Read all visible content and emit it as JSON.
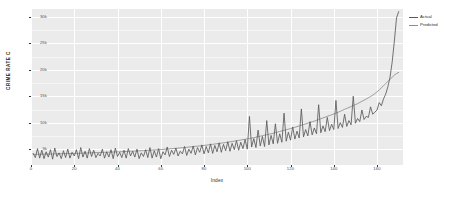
{
  "chart_data": {
    "type": "line",
    "title": "",
    "xlabel": "Index",
    "ylabel": "CRIME RATE C",
    "xlim": [
      0,
      172
    ],
    "ylim": [
      2000,
      31500
    ],
    "grid": true,
    "legend_position": "right",
    "xticks": [
      {
        "value": 0,
        "label": "0"
      },
      {
        "value": 20,
        "label": "20"
      },
      {
        "value": 40,
        "label": "40"
      },
      {
        "value": 60,
        "label": "60"
      },
      {
        "value": 80,
        "label": "80"
      },
      {
        "value": 100,
        "label": "100"
      },
      {
        "value": 120,
        "label": "120"
      },
      {
        "value": 140,
        "label": "140"
      },
      {
        "value": 160,
        "label": "160"
      }
    ],
    "yticks": [
      {
        "value": 5000,
        "label": "5k"
      },
      {
        "value": 10000,
        "label": "10k"
      },
      {
        "value": 15000,
        "label": "15k"
      },
      {
        "value": 20000,
        "label": "20k"
      },
      {
        "value": 25000,
        "label": "25k"
      },
      {
        "value": 30000,
        "label": "30k"
      }
    ],
    "series": [
      {
        "name": "Actual",
        "color": "#5a5a5a",
        "x": [
          1,
          2,
          3,
          4,
          5,
          6,
          7,
          8,
          9,
          10,
          11,
          12,
          13,
          14,
          15,
          16,
          17,
          18,
          19,
          20,
          21,
          22,
          23,
          24,
          25,
          26,
          27,
          28,
          29,
          30,
          31,
          32,
          33,
          34,
          35,
          36,
          37,
          38,
          39,
          40,
          41,
          42,
          43,
          44,
          45,
          46,
          47,
          48,
          49,
          50,
          51,
          52,
          53,
          54,
          55,
          56,
          57,
          58,
          59,
          60,
          61,
          62,
          63,
          64,
          65,
          66,
          67,
          68,
          69,
          70,
          71,
          72,
          73,
          74,
          75,
          76,
          77,
          78,
          79,
          80,
          81,
          82,
          83,
          84,
          85,
          86,
          87,
          88,
          89,
          90,
          91,
          92,
          93,
          94,
          95,
          96,
          97,
          98,
          99,
          100,
          101,
          102,
          103,
          104,
          105,
          106,
          107,
          108,
          109,
          110,
          111,
          112,
          113,
          114,
          115,
          116,
          117,
          118,
          119,
          120,
          121,
          122,
          123,
          124,
          125,
          126,
          127,
          128,
          129,
          130,
          131,
          132,
          133,
          134,
          135,
          136,
          137,
          138,
          139,
          140,
          141,
          142,
          143,
          144,
          145,
          146,
          147,
          148,
          149,
          150,
          151,
          152,
          153,
          154,
          155,
          156,
          157,
          158,
          159,
          160,
          161,
          162,
          163,
          164,
          165,
          166,
          167,
          168,
          169,
          170
        ],
        "values": [
          4200,
          3400,
          5100,
          3300,
          4800,
          3200,
          4500,
          3500,
          4900,
          3100,
          5200,
          3600,
          4300,
          3200,
          4700,
          3400,
          5000,
          3300,
          4400,
          3700,
          4900,
          3200,
          5300,
          3500,
          4600,
          3300,
          5100,
          3600,
          4800,
          3400,
          4200,
          3700,
          5000,
          3300,
          4500,
          3500,
          4900,
          3200,
          5200,
          3600,
          4400,
          3400,
          4800,
          3300,
          5100,
          3700,
          4600,
          3500,
          5000,
          3200,
          4300,
          3600,
          4900,
          3400,
          5300,
          3300,
          4700,
          3500,
          5100,
          3200,
          4500,
          3900,
          5400,
          3600,
          4800,
          4000,
          5200,
          3700,
          4600,
          4100,
          5500,
          3800,
          5000,
          4200,
          5600,
          3900,
          5300,
          4400,
          5800,
          4100,
          5500,
          4300,
          6000,
          4200,
          5700,
          4500,
          6200,
          4400,
          5900,
          4700,
          6400,
          4600,
          6100,
          4900,
          6600,
          4800,
          6300,
          5100,
          6800,
          5000,
          11200,
          5400,
          7000,
          5300,
          8600,
          5600,
          7400,
          5500,
          10400,
          5800,
          7600,
          6000,
          9800,
          6100,
          7900,
          6300,
          11800,
          6500,
          8200,
          6700,
          9200,
          6900,
          8400,
          7100,
          12600,
          7300,
          8700,
          7500,
          10200,
          7700,
          9000,
          7900,
          13400,
          8100,
          9400,
          8300,
          11000,
          8500,
          9700,
          8700,
          14200,
          8900,
          10000,
          9100,
          11600,
          9300,
          10400,
          9600,
          15000,
          9900,
          10800,
          10200,
          12400,
          10600,
          11200,
          11000,
          13000,
          11600,
          12000,
          12400,
          13800,
          13200,
          14500,
          15400,
          16800,
          18600,
          21500,
          25400,
          29800,
          31000
        ]
      },
      {
        "name": "Predicted",
        "color": "#8c8c8c",
        "x": [
          1,
          2,
          3,
          4,
          5,
          6,
          7,
          8,
          9,
          10,
          11,
          12,
          13,
          14,
          15,
          16,
          17,
          18,
          19,
          20,
          21,
          22,
          23,
          24,
          25,
          26,
          27,
          28,
          29,
          30,
          31,
          32,
          33,
          34,
          35,
          36,
          37,
          38,
          39,
          40,
          41,
          42,
          43,
          44,
          45,
          46,
          47,
          48,
          49,
          50,
          51,
          52,
          53,
          54,
          55,
          56,
          57,
          58,
          59,
          60,
          61,
          62,
          63,
          64,
          65,
          66,
          67,
          68,
          69,
          70,
          71,
          72,
          73,
          74,
          75,
          76,
          77,
          78,
          79,
          80,
          81,
          82,
          83,
          84,
          85,
          86,
          87,
          88,
          89,
          90,
          91,
          92,
          93,
          94,
          95,
          96,
          97,
          98,
          99,
          100,
          101,
          102,
          103,
          104,
          105,
          106,
          107,
          108,
          109,
          110,
          111,
          112,
          113,
          114,
          115,
          116,
          117,
          118,
          119,
          120,
          121,
          122,
          123,
          124,
          125,
          126,
          127,
          128,
          129,
          130,
          131,
          132,
          133,
          134,
          135,
          136,
          137,
          138,
          139,
          140,
          141,
          142,
          143,
          144,
          145,
          146,
          147,
          148,
          149,
          150,
          151,
          152,
          153,
          154,
          155,
          156,
          157,
          158,
          159,
          160,
          161,
          162,
          163,
          164,
          165,
          166,
          167,
          168,
          169,
          170
        ],
        "values": [
          4000,
          4010,
          4020,
          4030,
          4040,
          4050,
          4060,
          4070,
          4080,
          4090,
          4100,
          4110,
          4120,
          4130,
          4140,
          4150,
          4160,
          4170,
          4180,
          4190,
          4200,
          4215,
          4230,
          4245,
          4260,
          4275,
          4290,
          4305,
          4320,
          4335,
          4350,
          4365,
          4380,
          4395,
          4410,
          4425,
          4440,
          4455,
          4470,
          4485,
          4500,
          4520,
          4540,
          4560,
          4580,
          4600,
          4620,
          4640,
          4660,
          4680,
          4700,
          4725,
          4750,
          4775,
          4800,
          4825,
          4850,
          4875,
          4900,
          4925,
          4950,
          4985,
          5020,
          5055,
          5090,
          5125,
          5160,
          5195,
          5230,
          5265,
          5300,
          5345,
          5390,
          5435,
          5480,
          5525,
          5570,
          5615,
          5660,
          5705,
          5750,
          5805,
          5860,
          5915,
          5970,
          6025,
          6080,
          6135,
          6190,
          6245,
          6300,
          6370,
          6440,
          6510,
          6580,
          6650,
          6720,
          6790,
          6860,
          6930,
          7000,
          7090,
          7180,
          7270,
          7360,
          7450,
          7540,
          7630,
          7720,
          7810,
          7900,
          8010,
          8120,
          8230,
          8340,
          8450,
          8560,
          8670,
          8780,
          8890,
          9000,
          9130,
          9260,
          9390,
          9520,
          9650,
          9780,
          9910,
          10040,
          10170,
          10300,
          10450,
          10600,
          10750,
          10900,
          11050,
          11200,
          11350,
          11500,
          11650,
          11800,
          11980,
          12160,
          12340,
          12520,
          12700,
          12880,
          13060,
          13240,
          13420,
          13600,
          13820,
          14040,
          14260,
          14480,
          14700,
          14950,
          15200,
          15500,
          15850,
          16200,
          16600,
          17000,
          17400,
          17800,
          18200,
          18600,
          19000,
          19300,
          19500
        ]
      }
    ]
  },
  "legend": {
    "items": [
      {
        "label": "Actual"
      },
      {
        "label": "Predicted"
      }
    ]
  },
  "colors": {
    "panel_background": "#ebebeb",
    "gridline": "#ffffff",
    "actual": "#5a5a5a",
    "predicted": "#8c8c8c",
    "text": "#2b2b2b"
  }
}
